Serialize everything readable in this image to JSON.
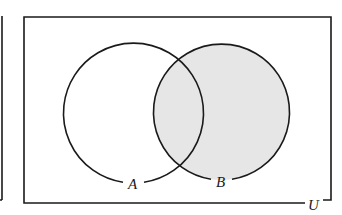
{
  "diagram": {
    "type": "venn",
    "universe": {
      "label": "U",
      "x": 24,
      "y": 17,
      "width": 307,
      "height": 186
    },
    "sets": [
      {
        "id": "A",
        "label": "A",
        "cx": 133.5,
        "cy": 113,
        "r": 70,
        "shaded": false
      },
      {
        "id": "B",
        "label": "B",
        "cx": 221,
        "cy": 112,
        "r": 68,
        "shaded": true
      }
    ],
    "shaded_region": "B",
    "colors": {
      "stroke": "#1a1a1a",
      "shade": "#e6e6e6",
      "background": "#ffffff"
    },
    "left_fragment": {
      "x": 2,
      "y1": 17,
      "y2": 200
    }
  }
}
